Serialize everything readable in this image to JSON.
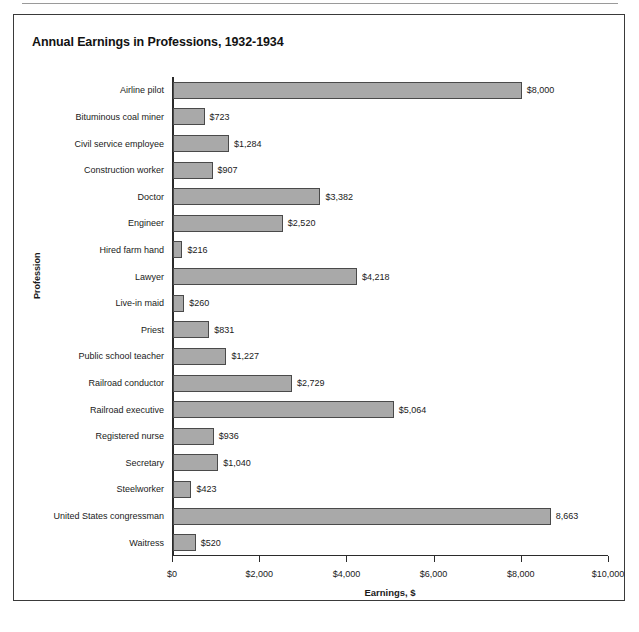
{
  "chart_data": {
    "type": "bar",
    "orientation": "horizontal",
    "title": "Annual Earnings in Professions, 1932-1934",
    "xlabel": "Earnings, $",
    "ylabel": "Profession",
    "xlim": [
      0,
      10000
    ],
    "grid": false,
    "legend": false,
    "xticks": [
      0,
      2000,
      4000,
      6000,
      8000,
      10000
    ],
    "xticklabels": [
      "$0",
      "$2,000",
      "$4,000",
      "$6,000",
      "$8,000",
      "$10,000"
    ],
    "categories": [
      "Airline pilot",
      "Bituminous coal miner",
      "Civil service employee",
      "Construction worker",
      "Doctor",
      "Engineer",
      "Hired farm hand",
      "Lawyer",
      "Live-in maid",
      "Priest",
      "Public school teacher",
      "Railroad conductor",
      "Railroad executive",
      "Registered nurse",
      "Secretary",
      "Steelworker",
      "United States congressman",
      "Waitress"
    ],
    "values": [
      8000,
      723,
      1284,
      907,
      3382,
      2520,
      216,
      4218,
      260,
      831,
      1227,
      2729,
      5064,
      936,
      1040,
      423,
      8663,
      520
    ],
    "data_labels": [
      "$8,000",
      "$723",
      "$1,284",
      "$907",
      "$3,382",
      "$2,520",
      "$216",
      "$4,218",
      "$260",
      "$831",
      "$1,227",
      "$2,729",
      "$5,064",
      "$936",
      "$1,040",
      "$423",
      "8,663",
      "$520"
    ],
    "bar_color": "#a9a9a9",
    "bar_edge_color": "#4a4a4a"
  },
  "page": {
    "bottom_sliver_text": ""
  }
}
